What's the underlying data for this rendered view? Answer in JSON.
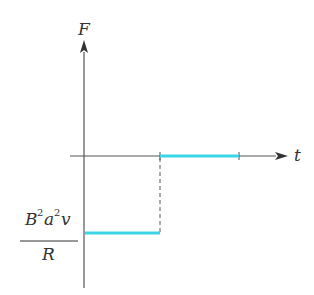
{
  "diagram": {
    "type": "step-function-plot",
    "axes": {
      "y_label": "F",
      "x_label": "t"
    },
    "y_value_label": {
      "numerator": "B²a²v",
      "numerator_parts": [
        "B",
        "2",
        "a",
        "2",
        "v"
      ],
      "denominator": "R"
    },
    "colors": {
      "axis": "#555555",
      "segment": "#3ad6e6",
      "dashed": "#555555",
      "text": "#333333"
    },
    "segments": [
      {
        "name": "negative-segment",
        "x_start": 0,
        "x_end": 1,
        "level": "-B²a²v/R"
      },
      {
        "name": "zero-segment",
        "x_start": 1,
        "x_end": 2,
        "level": "0"
      }
    ]
  }
}
